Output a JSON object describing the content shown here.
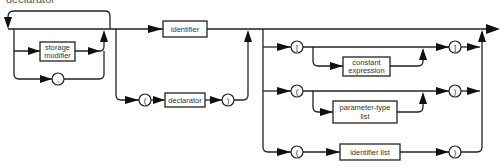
{
  "diagram": {
    "type": "syntax-diagram",
    "header": "declarator",
    "nodes": {
      "storage_modifier": {
        "line1": "storage",
        "line2": "modifier"
      },
      "comma": ",",
      "identifier": "identifier",
      "open_paren_declarator": "(",
      "declarator": "declarator",
      "close_paren_declarator": ")",
      "open_bracket": "[",
      "constant_expression": {
        "line1": "constant",
        "line2": "expression"
      },
      "close_bracket": "]",
      "open_paren_params": "(",
      "parameter_type_list": {
        "line1": "parameter-type",
        "line2": "list"
      },
      "close_paren_params": ")",
      "open_paren_idlist": "(",
      "identifier_list": "identifier list",
      "close_paren_idlist": ")"
    },
    "colors": {
      "line": "#222222",
      "background": "#ffffff",
      "text": "#333333"
    }
  }
}
